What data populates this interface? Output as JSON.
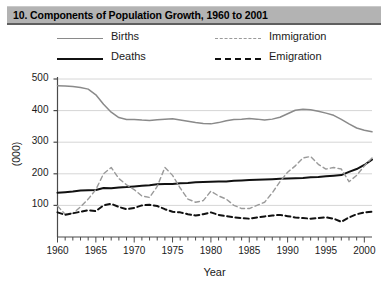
{
  "banner": {
    "title": "10. Components of Population Growth, 1960 to 2001"
  },
  "legend": {
    "items": [
      {
        "label": "Births",
        "key": "solid-gray-line",
        "color": "#8a8a8a"
      },
      {
        "label": "Deaths",
        "key": "solid-black-line",
        "color": "#111111"
      },
      {
        "label": "Immigration",
        "key": "dashed-gray-line",
        "color": "#9a9a9a"
      },
      {
        "label": "Emigration",
        "key": "dashed-black-line",
        "color": "#111111"
      }
    ]
  },
  "chart_data": {
    "type": "line",
    "title": "10. Components of Population Growth, 1960 to 2001",
    "xlabel": "Year",
    "ylabel": "(000)",
    "xlim": [
      1960,
      2001
    ],
    "ylim": [
      0,
      500
    ],
    "yticks": [
      100,
      200,
      300,
      400,
      500
    ],
    "xticks": [
      1960,
      1965,
      1970,
      1975,
      1980,
      1985,
      1990,
      1995,
      2000
    ],
    "xtick_minor_step": 1,
    "grid": "horizontal",
    "legend_position": "above-plot",
    "x": [
      1960,
      1961,
      1962,
      1963,
      1964,
      1965,
      1966,
      1967,
      1968,
      1969,
      1970,
      1971,
      1972,
      1973,
      1974,
      1975,
      1976,
      1977,
      1978,
      1979,
      1980,
      1981,
      1982,
      1983,
      1984,
      1985,
      1986,
      1987,
      1988,
      1989,
      1990,
      1991,
      1992,
      1993,
      1994,
      1995,
      1996,
      1997,
      1998,
      1999,
      2000,
      2001
    ],
    "series": [
      {
        "name": "Births",
        "color": "#8a8a8a",
        "style": "solid",
        "values": [
          479,
          478,
          476,
          473,
          468,
          450,
          420,
          395,
          378,
          372,
          372,
          370,
          369,
          371,
          373,
          374,
          370,
          366,
          362,
          359,
          358,
          362,
          368,
          372,
          373,
          375,
          373,
          370,
          373,
          379,
          390,
          401,
          404,
          403,
          398,
          392,
          385,
          372,
          358,
          345,
          338,
          333
        ]
      },
      {
        "name": "Deaths",
        "color": "#111111",
        "style": "solid",
        "values": [
          140,
          142,
          144,
          147,
          148,
          149,
          155,
          154,
          157,
          158,
          160,
          162,
          164,
          167,
          168,
          168,
          170,
          171,
          173,
          174,
          175,
          176,
          176,
          178,
          179,
          180,
          181,
          182,
          183,
          184,
          185,
          186,
          187,
          189,
          190,
          192,
          194,
          196,
          206,
          215,
          228,
          245
        ]
      },
      {
        "name": "Immigration",
        "color": "#9a9a9a",
        "style": "dashed",
        "values": [
          98,
          72,
          75,
          95,
          120,
          150,
          200,
          220,
          185,
          165,
          150,
          130,
          125,
          160,
          220,
          195,
          155,
          120,
          110,
          115,
          145,
          130,
          120,
          100,
          90,
          90,
          100,
          110,
          140,
          175,
          205,
          225,
          250,
          255,
          230,
          215,
          220,
          215,
          175,
          195,
          225,
          250
        ]
      },
      {
        "name": "Emigration",
        "color": "#111111",
        "style": "dashed",
        "values": [
          78,
          70,
          75,
          80,
          85,
          82,
          100,
          105,
          95,
          88,
          92,
          100,
          102,
          98,
          88,
          80,
          78,
          72,
          68,
          72,
          78,
          70,
          66,
          62,
          60,
          58,
          62,
          65,
          68,
          70,
          66,
          62,
          60,
          58,
          60,
          62,
          58,
          48,
          62,
          72,
          78,
          80
        ]
      }
    ]
  }
}
